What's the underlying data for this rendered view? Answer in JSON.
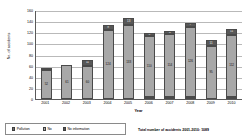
{
  "chart_data": {
    "type": "bar",
    "stacked": true,
    "title": "",
    "xlabel": "Year",
    "ylabel": "No. of accidents",
    "ylim": [
      0,
      160
    ],
    "ytick_step": 20,
    "ytick_labels": [
      "160",
      "140",
      "120",
      "100",
      "80",
      "60",
      "40",
      "20",
      "0"
    ],
    "grid": true,
    "legend_position": "bottom-left",
    "categories": [
      "2001",
      "2002",
      "2003",
      "2004",
      "2005",
      "2006",
      "2007",
      "2008",
      "2009",
      "2010"
    ],
    "series": [
      {
        "name": "Pollution",
        "color": "#6f6f6f",
        "values": [
          0,
          0,
          0,
          0,
          0,
          2,
          2,
          3,
          0,
          2
        ],
        "labels": [
          "",
          "",
          "",
          "",
          "",
          "2",
          "2",
          "3",
          "",
          "2"
        ]
      },
      {
        "name": "No",
        "color": "#a8a8a8",
        "values": [
          52,
          61,
          60,
          124,
          133,
          110,
          114,
          126,
          95,
          112
        ],
        "labels": [
          "52",
          "61",
          "60",
          "124",
          "133",
          "110",
          "114",
          "126",
          "95",
          "112"
        ]
      },
      {
        "name": "No information",
        "color": "#585858",
        "values": [
          4,
          0,
          11,
          9,
          13,
          5,
          4,
          7,
          11,
          11
        ],
        "labels": [
          "4",
          "",
          "11",
          "9",
          "13",
          "5",
          "4",
          "7",
          "11",
          "11"
        ]
      }
    ],
    "totals": [
      56,
      61,
      71,
      133,
      146,
      117,
      120,
      136,
      106,
      125
    ]
  },
  "legend": {
    "items": [
      {
        "label": "Pollution",
        "swatch_class": "sw-pollution",
        "icon": "legend-swatch-pollution"
      },
      {
        "label": "No",
        "swatch_class": "sw-no",
        "icon": "legend-swatch-no"
      },
      {
        "label": "No information",
        "swatch_class": "sw-noinfo",
        "icon": "legend-swatch-no-information"
      }
    ]
  },
  "footer": {
    "total_note": "Total number of accidents 2001-2010: 1089"
  }
}
